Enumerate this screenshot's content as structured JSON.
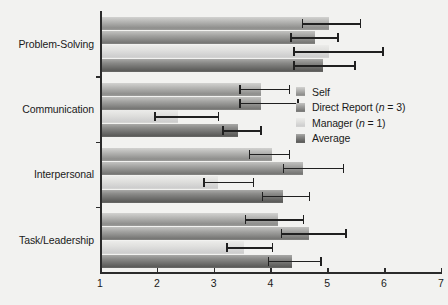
{
  "chart_data": {
    "type": "bar",
    "orientation": "horizontal",
    "title": "",
    "xlabel": "",
    "ylabel": "",
    "xlim": [
      1,
      7
    ],
    "xticks": [
      1,
      2,
      3,
      4,
      5,
      6,
      7
    ],
    "grid": false,
    "legend_position": "right",
    "categories": [
      "Problem-Solving",
      "Communication",
      "Interpersonal",
      "Task/Leadership"
    ],
    "series": [
      {
        "name": "Self",
        "color": "#b6b6b4",
        "values": [
          5.0,
          3.8,
          4.0,
          4.1
        ],
        "err_low": [
          4.55,
          3.45,
          3.62,
          3.55
        ],
        "err_high": [
          5.6,
          4.35,
          4.35,
          4.6
        ]
      },
      {
        "name": "Direct Report (n = 3)",
        "color": "#a3a3a1",
        "values": [
          4.75,
          3.8,
          4.55,
          4.65
        ],
        "err_low": [
          4.35,
          3.45,
          4.22,
          4.18
        ],
        "err_high": [
          5.2,
          4.5,
          5.3,
          5.35
        ]
      },
      {
        "name": "Manager (n = 1)",
        "color": "#e0e0de",
        "values": [
          5.0,
          2.35,
          3.05,
          3.5
        ],
        "err_low": [
          4.4,
          1.95,
          2.82,
          3.22
        ],
        "err_high": [
          6.0,
          3.1,
          3.72,
          4.05
        ]
      },
      {
        "name": "Average",
        "color": "#8a8a88",
        "values": [
          4.9,
          3.4,
          4.2,
          4.35
        ],
        "err_low": [
          4.4,
          3.15,
          3.85,
          3.95
        ],
        "err_high": [
          5.5,
          3.85,
          4.7,
          4.9
        ]
      }
    ]
  },
  "legend": {
    "items": [
      {
        "label": "Self",
        "color": "#b6b6b4"
      },
      {
        "label_prefix": "Direct Report (",
        "label_var": "n",
        "label_suffix": " = 3)",
        "color": "#a3a3a1"
      },
      {
        "label_prefix": "Manager (",
        "label_var": "n",
        "label_suffix": " = 1)",
        "color": "#e0e0de"
      },
      {
        "label": "Average",
        "color": "#8a8a88"
      }
    ]
  },
  "axis": {
    "x_tick_labels": [
      "1",
      "2",
      "3",
      "4",
      "5",
      "6",
      "7"
    ],
    "y_tick_labels": [
      "Problem-Solving",
      "Communication",
      "Interpersonal",
      "Task/Leadership"
    ]
  }
}
